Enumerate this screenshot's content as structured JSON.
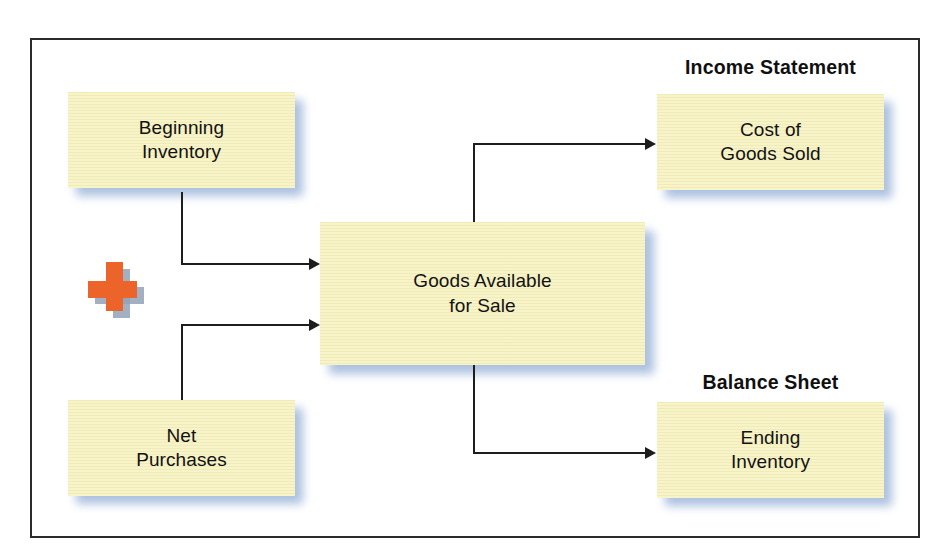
{
  "diagram": {
    "type": "flowchart",
    "colors": {
      "box_fill": "#f8f4c9",
      "box_shadow": "#9db6da",
      "line": "#1d1d1d",
      "plus_orange": "#ed642a",
      "plus_shadow": "#93a2b8",
      "frame_border": "#2b2b2b",
      "text": "#121212",
      "background": "#ffffff"
    },
    "boxes": [
      {
        "id": "beginning-inventory",
        "line1": "Beginning",
        "line2": "Inventory"
      },
      {
        "id": "net-purchases",
        "line1": "Net",
        "line2": "Purchases"
      },
      {
        "id": "goods-available-for-sale",
        "line1": "Goods Available",
        "line2": "for Sale"
      },
      {
        "id": "cost-of-goods-sold",
        "line1": "Cost of",
        "line2": "Goods Sold"
      },
      {
        "id": "ending-inventory",
        "line1": "Ending",
        "line2": "Inventory"
      }
    ],
    "headers": [
      {
        "id": "income-statement",
        "text": "Income Statement"
      },
      {
        "id": "balance-sheet",
        "text": "Balance Sheet"
      }
    ],
    "operators": [
      {
        "id": "plus",
        "symbol": "+",
        "name": "plus-sign"
      }
    ],
    "connections": [
      {
        "from": "beginning-inventory",
        "to": "goods-available-for-sale"
      },
      {
        "from": "net-purchases",
        "to": "goods-available-for-sale"
      },
      {
        "from": "goods-available-for-sale",
        "to": "cost-of-goods-sold"
      },
      {
        "from": "goods-available-for-sale",
        "to": "ending-inventory"
      }
    ]
  }
}
